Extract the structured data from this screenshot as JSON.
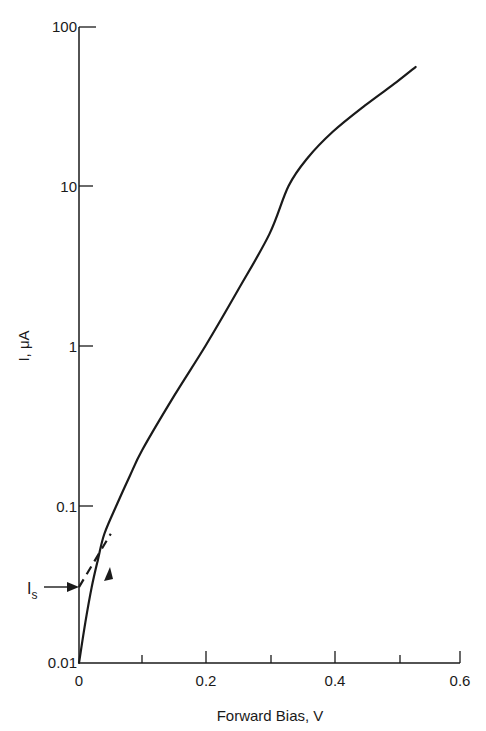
{
  "chart_data": {
    "type": "line",
    "title": "",
    "xlabel": "Forward Bias, V",
    "ylabel": "I, μA",
    "xscale": "linear",
    "yscale": "log",
    "xlim": [
      0,
      0.6
    ],
    "ylim": [
      0.01,
      100
    ],
    "x_ticks": [
      "0",
      "0.2",
      "0.4",
      "0.6"
    ],
    "x_minor_ticks": [
      0.1,
      0.3,
      0.5
    ],
    "y_ticks": [
      "0.01",
      "0.1",
      "1",
      "10",
      "100"
    ],
    "grid": false,
    "series": [
      {
        "name": "diode forward I-V",
        "style": "solid",
        "x": [
          0.0,
          0.01,
          0.02,
          0.03,
          0.04,
          0.06,
          0.08,
          0.1,
          0.15,
          0.2,
          0.25,
          0.3,
          0.33,
          0.36,
          0.4,
          0.45,
          0.5,
          0.53
        ],
        "y": [
          0.01,
          0.018,
          0.03,
          0.045,
          0.065,
          0.1,
          0.15,
          0.22,
          0.48,
          1.0,
          2.2,
          5.0,
          10.0,
          15.0,
          22.0,
          32.0,
          45.0,
          56.0
        ]
      },
      {
        "name": "extrapolation to Is",
        "style": "dashed",
        "x": [
          0.0,
          0.05
        ],
        "y": [
          0.03,
          0.065
        ]
      }
    ],
    "annotations": [
      {
        "text": "I",
        "subscript": "s",
        "meaning": "saturation current",
        "x": 0.0,
        "y": 0.03,
        "arrow": true
      }
    ]
  }
}
